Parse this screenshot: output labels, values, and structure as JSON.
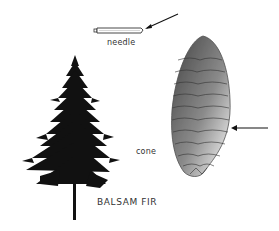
{
  "diagram": {
    "title": "BALSAM FIR",
    "labels": {
      "needle": "needle",
      "cone": "cone"
    },
    "parts": [
      {
        "name": "tree",
        "description": "silhouette of balsam fir tree"
      },
      {
        "name": "needle",
        "description": "single flat needle with arrow"
      },
      {
        "name": "cone",
        "description": "upright cylindrical cone with scales, arrow pointing to it"
      }
    ],
    "colors": {
      "ink": "#111111",
      "background": "#ffffff"
    }
  }
}
